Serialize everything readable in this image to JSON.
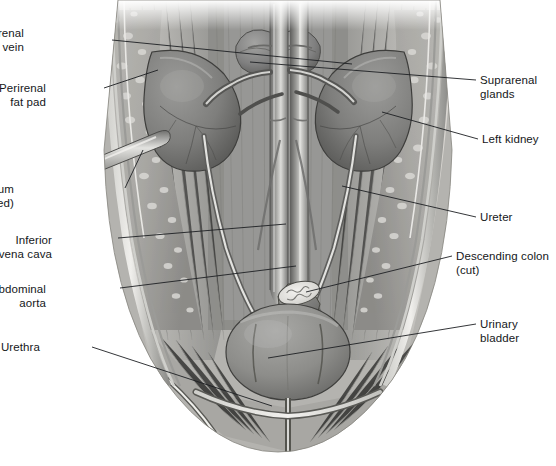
{
  "figure": {
    "style": "grayscale medical illustration",
    "width": 556,
    "height": 466,
    "background_color": "#ffffff",
    "ink_color": "#15171a"
  },
  "labels": {
    "left": [
      {
        "id": "right-renal-artery-and-vein",
        "lines": [
          "Right renal",
          "artery and vein"
        ],
        "text": "Right renal artery and vein",
        "x": 24,
        "y": 27,
        "side": "left",
        "leader": [
          [
            112,
            40
          ],
          [
            352,
            64
          ]
        ]
      },
      {
        "id": "perirenal-fat-pad",
        "lines": [
          "Perirenal",
          "fat pad"
        ],
        "text": "Perirenal fat pad",
        "x": 46,
        "y": 82,
        "side": "left",
        "leader": [
          [
            104,
            88
          ],
          [
            158,
            70
          ]
        ]
      },
      {
        "id": "peritoneum-cut-and-reflected",
        "lines": [
          "Peritoneum",
          "(cut and reflected)"
        ],
        "text": "Peritoneum (cut and reflected)",
        "x": 14,
        "y": 183,
        "side": "left",
        "leader": [
          [
            125,
            188
          ],
          [
            143,
            150
          ]
        ]
      },
      {
        "id": "inferior-vena-cava",
        "lines": [
          "Inferior",
          "vena cava"
        ],
        "text": "Inferior vena cava",
        "x": 52,
        "y": 234,
        "side": "left",
        "leader": [
          [
            118,
            238
          ],
          [
            286,
            224
          ]
        ]
      },
      {
        "id": "abdominal-aorta",
        "lines": [
          "Abdominal",
          "aorta"
        ],
        "text": "Abdominal aorta",
        "x": 46,
        "y": 283,
        "side": "left",
        "leader": [
          [
            120,
            288
          ],
          [
            296,
            266
          ]
        ]
      },
      {
        "id": "urethra",
        "lines": [
          "Urethra"
        ],
        "text": "Urethra",
        "x": 40,
        "y": 341,
        "side": "left",
        "leader": [
          [
            92,
            347
          ],
          [
            272,
            406
          ]
        ]
      }
    ],
    "right": [
      {
        "id": "suprarenal-glands",
        "lines": [
          "Suprarenal",
          "glands"
        ],
        "text": "Suprarenal glands",
        "x": 480,
        "y": 74,
        "side": "right",
        "leader": [
          [
            476,
            80
          ],
          [
            250,
            62
          ]
        ]
      },
      {
        "id": "left-kidney",
        "lines": [
          "Left kidney"
        ],
        "text": "Left kidney",
        "x": 482,
        "y": 133,
        "side": "right",
        "leader": [
          [
            478,
            139
          ],
          [
            382,
            112
          ]
        ]
      },
      {
        "id": "ureter",
        "lines": [
          "Ureter"
        ],
        "text": "Ureter",
        "x": 480,
        "y": 211,
        "side": "right",
        "leader": [
          [
            476,
            217
          ],
          [
            342,
            186
          ]
        ]
      },
      {
        "id": "descending-colon-cut",
        "lines": [
          "Descending colon",
          "(cut)"
        ],
        "text": "Descending colon (cut)",
        "x": 456,
        "y": 250,
        "side": "right",
        "leader": [
          [
            452,
            256
          ],
          [
            306,
            292
          ]
        ]
      },
      {
        "id": "urinary-bladder",
        "lines": [
          "Urinary",
          "bladder"
        ],
        "text": "Urinary bladder",
        "x": 480,
        "y": 318,
        "side": "right",
        "leader": [
          [
            476,
            324
          ],
          [
            268,
            358
          ]
        ]
      }
    ]
  },
  "structures": {
    "right_kidney": {
      "name": "Right kidney",
      "visible": true
    },
    "left_kidney": {
      "name": "Left kidney",
      "visible": true
    },
    "suprarenal_gland_right": {
      "name": "Right suprarenal gland",
      "visible": true
    },
    "suprarenal_gland_left": {
      "name": "Left suprarenal gland",
      "visible": true
    },
    "abdominal_aorta": {
      "name": "Abdominal aorta",
      "visible": true
    },
    "inferior_vena_cava": {
      "name": "Inferior vena cava",
      "visible": true
    },
    "ureter_right": {
      "name": "Right ureter",
      "visible": true
    },
    "ureter_left": {
      "name": "Left ureter",
      "visible": true
    },
    "urinary_bladder": {
      "name": "Urinary bladder",
      "visible": true
    },
    "urethra": {
      "name": "Urethra",
      "visible": true
    },
    "descending_colon_cut": {
      "name": "Descending colon (cut)",
      "visible": true
    },
    "perirenal_fat_pad": {
      "name": "Perirenal fat pad",
      "visible": true
    },
    "peritoneum": {
      "name": "Peritoneum (cut and reflected)",
      "visible": true
    },
    "psoas_major": {
      "name": "Psoas major muscle",
      "visible": true
    },
    "quadratus_lumborum": {
      "name": "Quadratus lumborum muscle",
      "visible": true
    },
    "iliacus": {
      "name": "Iliacus muscle",
      "visible": true
    },
    "inguinal_ligament": {
      "name": "Inguinal ligament",
      "visible": true
    }
  },
  "palette": {
    "paper": "#ffffff",
    "muscle_light": "#c9c9c7",
    "muscle_mid": "#a9a9a7",
    "muscle_dark": "#7d7d7b",
    "organ_light": "#9e9e9c",
    "organ_mid": "#868684",
    "organ_dark": "#5f5f5d",
    "fat_light": "#d5d5d2",
    "vessel_light": "#e8e8e6",
    "vessel_dark": "#6a6a68",
    "outline": "#3a3a38",
    "leader": "#1d1f22"
  }
}
